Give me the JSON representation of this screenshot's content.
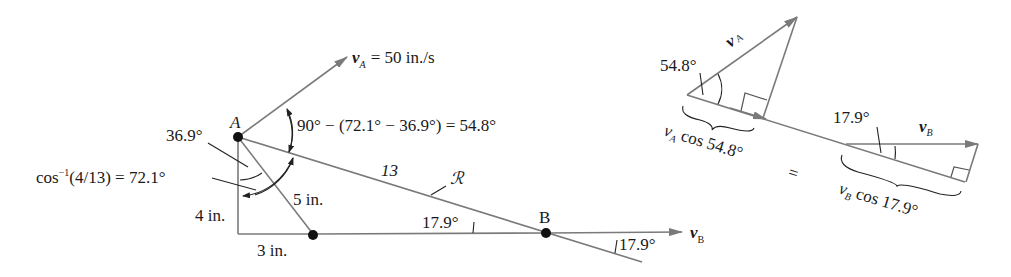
{
  "left_diagram": {
    "point_a_label": "A",
    "point_b_label": "B",
    "va_label": "v",
    "va_sub": "A",
    "va_value": "= 50 in./s",
    "angle_expression": "90° − (72.1° − 36.9°) = 54.8°",
    "angle_36_9": "36.9°",
    "angle_cos_label": "cos",
    "angle_cos_exp": "−1",
    "angle_cos_rest": "(4/13) = 72.1°",
    "side_5": "5 in.",
    "side_4": "4 in.",
    "side_3": "3 in.",
    "link_length": "13",
    "link_label": "ℛ",
    "angle_b_inner": "17.9°",
    "angle_b_outer": "17.9°",
    "vb_label": "v",
    "vb_sub": "B"
  },
  "right_diagram": {
    "va_label": "v",
    "va_sub": "A",
    "angle_a": "54.8°",
    "va_component": "v",
    "va_component_sub": "A",
    "va_component_rest": " cos 54.8°",
    "equals": "=",
    "angle_b": "17.9°",
    "vb_label": "v",
    "vb_sub": "B",
    "vb_component": "v",
    "vb_component_sub": "B",
    "vb_component_rest": " cos 17.9°"
  }
}
